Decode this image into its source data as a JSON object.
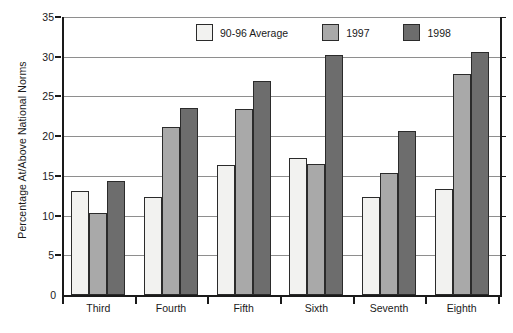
{
  "chart_data": {
    "type": "bar",
    "title": "",
    "subtitle": "",
    "xlabel": "",
    "ylabel": "Percentage At/Above National Norms",
    "categories": [
      "Third",
      "Fourth",
      "Fifth",
      "Sixth",
      "Seventh",
      "Eighth"
    ],
    "series": [
      {
        "name": "90-96 Average",
        "color": "#f2f2f0",
        "values": [
          13.1,
          12.4,
          16.4,
          17.2,
          12.4,
          13.3
        ]
      },
      {
        "name": "1997",
        "color": "#a9a9a9",
        "values": [
          10.3,
          21.1,
          23.4,
          16.5,
          15.3,
          27.8
        ]
      },
      {
        "name": "1998",
        "color": "#6d6d6d",
        "values": [
          14.3,
          23.5,
          27.0,
          30.2,
          20.7,
          30.6
        ]
      }
    ],
    "ylim": [
      0,
      35
    ],
    "yticks": [
      0,
      5,
      10,
      15,
      20,
      25,
      30,
      35
    ],
    "ytick_labels": [
      "0",
      "5",
      "10",
      "15",
      "20",
      "25",
      "30",
      "35"
    ],
    "grid": true,
    "legend_position": "top-center",
    "axis_color": "#1a1a1a",
    "gridline_color": "#8e8e8e"
  }
}
